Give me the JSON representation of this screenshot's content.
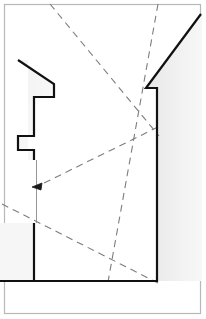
{
  "figure": {
    "title": "Architectural section line drawing with sight lines",
    "type": "line-drawing",
    "width": 206,
    "height": 319,
    "background_color": "#ffffff",
    "outline_color": "#111111",
    "dashed_line_color": "#7d7d7d",
    "frame_color": "#b8b8b8",
    "shading_color": "#eeeeee",
    "thin_line_color": "#8a8a8a"
  },
  "frame": {
    "name": "image-border",
    "x": 4,
    "y": 4,
    "width": 197,
    "height": 310,
    "stroke_width": 1.2
  },
  "shapes": {
    "wall_profile": {
      "name": "wall-section-profile",
      "description": "Heavy black outlined building section: left stepped jamb, right wall with notch and sloped top",
      "stroke_width": 2.2,
      "fill": "#ffffff",
      "points": "18,60 54,84 54,98 36,98 36,110 54,110 54,122 36,122 36,136 54,136 54,281 0,281"
    },
    "left_jamb": {
      "name": "left-jamb-profile",
      "stroke_width": 2.2,
      "vertices": [
        {
          "x": 18,
          "y": 60
        },
        {
          "x": 54,
          "y": 84
        },
        {
          "x": 54,
          "y": 97
        },
        {
          "x": 34,
          "y": 97
        },
        {
          "x": 34,
          "y": 136
        },
        {
          "x": 18,
          "y": 136
        },
        {
          "x": 18,
          "y": 150
        },
        {
          "x": 34,
          "y": 150
        },
        {
          "x": 34,
          "y": 160
        }
      ]
    },
    "lower_pier": {
      "name": "lower-pier-profile",
      "stroke_width": 2.2,
      "vertices": [
        {
          "x": 34,
          "y": 223
        },
        {
          "x": 34,
          "y": 280
        },
        {
          "x": 0,
          "y": 280
        }
      ]
    },
    "right_wall": {
      "name": "right-wall-profile",
      "stroke_width": 2.2,
      "vertices": [
        {
          "x": 201,
          "y": 14
        },
        {
          "x": 146,
          "y": 88
        },
        {
          "x": 157,
          "y": 88
        },
        {
          "x": 157,
          "y": 281
        },
        {
          "x": 34,
          "y": 281
        }
      ]
    },
    "shaded_wedge": {
      "name": "shaded-wall-mass",
      "fill": "#ededed",
      "description": "Light grey tone right of the sloping wall top"
    }
  },
  "sight_lines": {
    "name": "dashed-sight-lines",
    "dash_pattern": "7 5",
    "stroke_width": 1.1,
    "color": "#7d7d7d",
    "lines": [
      {
        "name": "sight-line-upper-left",
        "x1": 50,
        "y1": 0,
        "x2": 157,
        "y2": 132
      },
      {
        "name": "sight-line-upper-right",
        "x1": 158,
        "y1": 0,
        "x2": 110,
        "y2": 281
      },
      {
        "name": "sight-line-to-arrow",
        "x1": 157,
        "y1": 126,
        "x2": 36,
        "y2": 186
      },
      {
        "name": "sight-line-lower-left",
        "x1": 0,
        "y1": 205,
        "x2": 157,
        "y2": 281
      }
    ]
  },
  "annotations": {
    "arrow": {
      "name": "direction-arrow",
      "description": "Small solid arrowhead pointing left at end of sight line",
      "tip_x": 33,
      "tip_y": 187,
      "angle_deg": 205
    },
    "reference_line": {
      "name": "vertical-reference-line",
      "description": "Thin vertical construction line between jamb and lower pier",
      "x": 36,
      "y1": 160,
      "y2": 223,
      "stroke_width": 0.9,
      "color": "#8a8a8a"
    }
  },
  "labels": {
    "caption": "",
    "figure_number": ""
  }
}
